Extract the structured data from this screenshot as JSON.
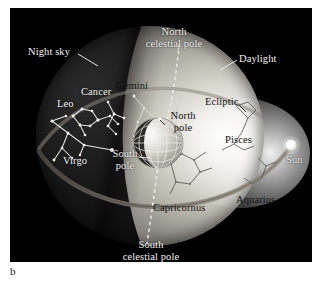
{
  "figure": {
    "caption_letter": "b",
    "kind": "celestial-sphere-diagram"
  },
  "colors": {
    "plate_background": "#000000",
    "page_background": "#ffffff",
    "night_side": "#121212",
    "day_side": "#dedbd2",
    "sun": "#ffffff",
    "ecliptic_band": "#6f6a62",
    "label_light": "#f2f2f2",
    "label_dark": "#111111",
    "constellation_star": "#ffffff",
    "constellation_line_night": "#e8e8e8",
    "constellation_line_day": "#4a4a4a",
    "celestial_axis": "#f0f0f0"
  },
  "labels": {
    "night_sky": "Night sky",
    "north_celestial_pole_line1": "North",
    "north_celestial_pole_line2": "celestial pole",
    "daylight": "Daylight",
    "gemini": "Gemini",
    "cancer": "Cancer",
    "leo": "Leo",
    "ecliptic": "Ecliptic",
    "north_pole_line1": "North",
    "north_pole_line2": "pole",
    "pisces": "Pisces",
    "virgo": "Virgo",
    "south_pole_line1": "South",
    "south_pole_line2": "pole",
    "sun": "Sun",
    "capricornus": "Capricornus",
    "aquarius": "Aquarius",
    "south_celestial_pole_line1": "South",
    "south_celestial_pole_line2": "celestial pole"
  },
  "diagram_elements": {
    "celestial_sphere": "celestial sphere with night and daylight hemispheres",
    "earth": "small Earth globe at centre with day/night terminator and latitude-longitude grid",
    "celestial_axis": "dashed line joining north and south celestial poles through Earth",
    "ecliptic": "great-circle band inclined to the celestial equator, passing through the Sun",
    "sun_marker": "bright sphere on the ecliptic at the right limb"
  },
  "constellations": [
    {
      "name": "Leo",
      "side": "night",
      "label_color": "#f2f2f2"
    },
    {
      "name": "Cancer",
      "side": "night",
      "label_color": "#f2f2f2"
    },
    {
      "name": "Gemini",
      "side": "daylight",
      "label_color": "#111111"
    },
    {
      "name": "Virgo",
      "side": "night",
      "label_color": "#f2f2f2"
    },
    {
      "name": "Pisces",
      "side": "daylight",
      "label_color": "#111111"
    },
    {
      "name": "Aquarius",
      "side": "daylight",
      "label_color": "#111111"
    },
    {
      "name": "Capricornus",
      "side": "daylight",
      "label_color": "#111111"
    }
  ],
  "leader_lines": [
    {
      "from": "night_sky",
      "to": "night hemisphere limb"
    },
    {
      "from": "daylight",
      "to": "daylight hemisphere limb"
    },
    {
      "from": "north_celestial_pole",
      "to": "top of celestial axis"
    },
    {
      "from": "north_pole",
      "to": "Earth north pole"
    },
    {
      "from": "south_pole",
      "to": "Earth south pole"
    },
    {
      "from": "south_celestial_pole",
      "to": "bottom of celestial axis"
    }
  ]
}
